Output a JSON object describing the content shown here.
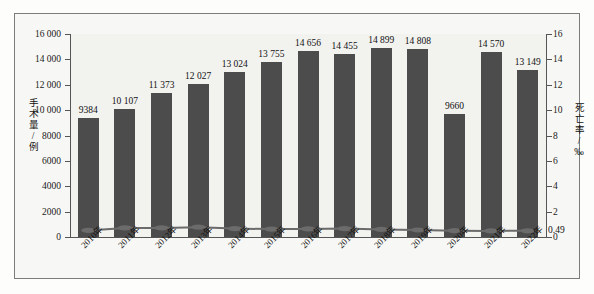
{
  "chart_data": {
    "type": "bar",
    "title": "",
    "subtitle": "",
    "xlabel": "",
    "ylabel": "手术量/例",
    "ylabel_secondary": "死亡率/‰",
    "categories": [
      "2010年",
      "2011年",
      "2012年",
      "2013年",
      "2014年",
      "2015年",
      "2016年",
      "2017年",
      "2018年",
      "2019年",
      "2020年",
      "2021年",
      "2022年"
    ],
    "ylim": [
      0,
      16000
    ],
    "ylim_secondary": [
      0,
      16
    ],
    "yticks": [
      "0",
      "2000",
      "4000",
      "6000",
      "8000",
      "10 000",
      "12 000",
      "14 000",
      "16 000"
    ],
    "ytick_values": [
      0,
      2000,
      4000,
      6000,
      8000,
      10000,
      12000,
      14000,
      16000
    ],
    "yticks_secondary": [
      "0",
      "2",
      "4",
      "6",
      "8",
      "10",
      "12",
      "14",
      "16"
    ],
    "ytick_values_secondary": [
      0,
      2,
      4,
      6,
      8,
      10,
      12,
      14,
      16
    ],
    "grid": false,
    "legend_position": "none",
    "series": [
      {
        "name": "手术量/例",
        "kind": "bar",
        "axis": "left",
        "color": "#4c4c4c",
        "values": [
          9384,
          10107,
          11373,
          12027,
          13024,
          13755,
          14656,
          14455,
          14899,
          14808,
          9660,
          14570,
          13149
        ],
        "labels": [
          "9384",
          "10 107",
          "11 373",
          "12 027",
          "13 024",
          "13 755",
          "14 656",
          "14 455",
          "14 899",
          "14 808",
          "9660",
          "14 570",
          "13 149"
        ]
      },
      {
        "name": "死亡率/‰",
        "kind": "line",
        "axis": "right",
        "color": "#6b6b6b",
        "marker": "ellipse",
        "values": [
          0.52,
          0.72,
          0.72,
          0.77,
          0.66,
          0.62,
          0.64,
          0.66,
          0.6,
          0.55,
          0.5,
          0.48,
          0.49
        ],
        "end_label": "0.49"
      }
    ],
    "annotations": [
      {
        "text": "0.49",
        "target": "line-series-last-point"
      }
    ]
  },
  "colors": {
    "bar": "#4c4c4c",
    "line": "#6b6b6b",
    "axis": "#555555",
    "plot_background": "#f2f2ef",
    "figure_background": "#fdfdfc",
    "frame_border": "#7c7c7c",
    "text": "#111111"
  }
}
